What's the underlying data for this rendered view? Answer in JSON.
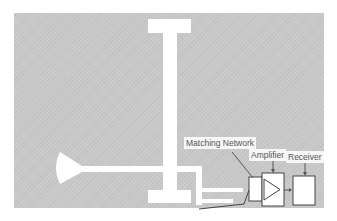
{
  "diagram": {
    "labels": {
      "matching_network": "Matching Network",
      "amplifier": "Amplifier",
      "receiver": "Receiver"
    },
    "colors": {
      "board": "#c9c9c9",
      "trace": "#ffffff",
      "line": "#444444"
    }
  }
}
